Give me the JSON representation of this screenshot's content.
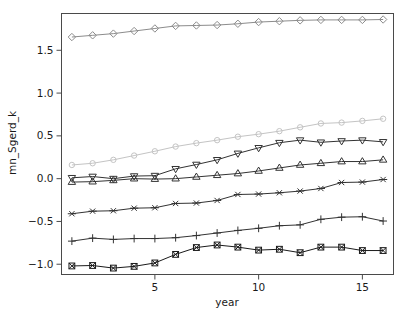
{
  "chart_data": {
    "type": "line",
    "title": "",
    "subtitle": "",
    "xlabel": "year",
    "ylabel": "mn_Sgerd_k",
    "xlim": [
      0.5,
      16.5
    ],
    "ylim": [
      -1.12,
      1.93
    ],
    "grid": false,
    "legend": "none",
    "x": [
      1,
      2,
      3,
      4,
      5,
      6,
      7,
      8,
      9,
      10,
      11,
      12,
      13,
      14,
      15,
      16
    ],
    "xticks": [
      5,
      10,
      15
    ],
    "xticklabels": [
      "5",
      "10",
      "15"
    ],
    "yticks": [
      -1.0,
      -0.5,
      0.0,
      0.5,
      1.0,
      1.5
    ],
    "yticklabels": [
      "-1.0",
      "-0.5",
      "0.0",
      "0.5",
      "1.0",
      "1.5"
    ],
    "series": [
      {
        "name": "series-diamond",
        "marker": "diamond",
        "color": "#8c8c8c",
        "values": [
          1.655,
          1.675,
          1.695,
          1.725,
          1.755,
          1.785,
          1.79,
          1.795,
          1.81,
          1.83,
          1.84,
          1.85,
          1.855,
          1.855,
          1.855,
          1.86
        ]
      },
      {
        "name": "series-circle",
        "marker": "circle",
        "color": "#c4c4c4",
        "values": [
          0.16,
          0.18,
          0.22,
          0.27,
          0.32,
          0.375,
          0.415,
          0.45,
          0.49,
          0.52,
          0.555,
          0.6,
          0.645,
          0.655,
          0.675,
          0.7
        ]
      },
      {
        "name": "series-triangle-down",
        "marker": "triangle-down",
        "color": "#333333",
        "values": [
          0.01,
          0.025,
          0.0,
          0.03,
          0.035,
          0.115,
          0.165,
          0.22,
          0.295,
          0.36,
          0.42,
          0.45,
          0.425,
          0.44,
          0.45,
          0.43
        ]
      },
      {
        "name": "series-triangle-up",
        "marker": "triangle-up",
        "color": "#333333",
        "values": [
          -0.04,
          -0.035,
          -0.02,
          0.0,
          -0.005,
          0.0,
          0.02,
          0.04,
          0.06,
          0.09,
          0.125,
          0.16,
          0.18,
          0.2,
          0.2,
          0.22
        ]
      },
      {
        "name": "series-cross",
        "marker": "cross",
        "color": "#333333",
        "values": [
          -0.41,
          -0.38,
          -0.375,
          -0.345,
          -0.34,
          -0.29,
          -0.285,
          -0.255,
          -0.185,
          -0.18,
          -0.165,
          -0.145,
          -0.115,
          -0.045,
          -0.04,
          -0.01
        ]
      },
      {
        "name": "series-plus",
        "marker": "plus",
        "color": "#333333",
        "values": [
          -0.73,
          -0.695,
          -0.71,
          -0.7,
          -0.7,
          -0.69,
          -0.665,
          -0.635,
          -0.605,
          -0.58,
          -0.55,
          -0.54,
          -0.475,
          -0.45,
          -0.445,
          -0.495
        ]
      },
      {
        "name": "series-square-cross",
        "marker": "square-cross",
        "color": "#1a1a1a",
        "values": [
          -1.02,
          -1.015,
          -1.045,
          -1.025,
          -0.985,
          -0.885,
          -0.805,
          -0.775,
          -0.8,
          -0.835,
          -0.825,
          -0.865,
          -0.8,
          -0.8,
          -0.84,
          -0.84
        ]
      }
    ]
  }
}
